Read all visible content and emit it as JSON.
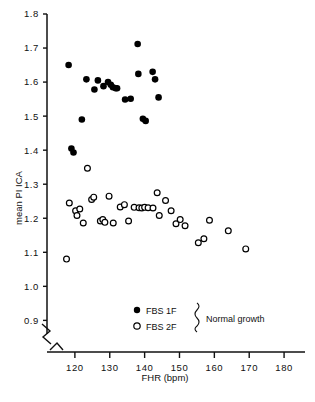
{
  "chart_data": {
    "type": "scatter",
    "title": "",
    "xlabel": "FHR (bpm)",
    "ylabel": "mean PI ICA",
    "xlim": [
      112,
      186
    ],
    "ylim": [
      0.86,
      1.8
    ],
    "xticks": [
      120,
      130,
      140,
      150,
      160,
      170,
      180
    ],
    "yticks": [
      0.9,
      1.0,
      1.1,
      1.2,
      1.3,
      1.4,
      1.5,
      1.6,
      1.7,
      1.8
    ],
    "grid": false,
    "axis_break": true,
    "legend_position": "lower-right",
    "annotations": [
      {
        "text": "Normal growth",
        "target": "legend-brace"
      }
    ],
    "series": [
      {
        "name": "FBS 1F",
        "marker": "filled-circle",
        "color": "#000000",
        "points": [
          [
            118.2,
            1.65
          ],
          [
            119.0,
            1.405
          ],
          [
            119.6,
            1.393
          ],
          [
            122.0,
            1.49
          ],
          [
            123.3,
            1.608
          ],
          [
            125.6,
            1.578
          ],
          [
            126.6,
            1.605
          ],
          [
            128.2,
            1.588
          ],
          [
            129.5,
            1.6
          ],
          [
            130.3,
            1.592
          ],
          [
            130.9,
            1.585
          ],
          [
            131.7,
            1.582
          ],
          [
            132.1,
            1.582
          ],
          [
            134.4,
            1.549
          ],
          [
            136.0,
            1.551
          ],
          [
            138.0,
            1.712
          ],
          [
            138.2,
            1.624
          ],
          [
            139.5,
            1.492
          ],
          [
            140.3,
            1.486
          ],
          [
            142.3,
            1.63
          ],
          [
            143.0,
            1.608
          ],
          [
            144.0,
            1.555
          ]
        ]
      },
      {
        "name": "FBS 2F",
        "marker": "open-circle",
        "color": "#000000",
        "points": [
          [
            117.6,
            1.08
          ],
          [
            118.4,
            1.245
          ],
          [
            120.2,
            1.222
          ],
          [
            120.6,
            1.208
          ],
          [
            121.4,
            1.227
          ],
          [
            122.4,
            1.186
          ],
          [
            123.6,
            1.347
          ],
          [
            124.8,
            1.255
          ],
          [
            125.4,
            1.262
          ],
          [
            127.3,
            1.192
          ],
          [
            128.0,
            1.196
          ],
          [
            128.6,
            1.188
          ],
          [
            129.8,
            1.265
          ],
          [
            131.0,
            1.186
          ],
          [
            133.0,
            1.233
          ],
          [
            134.2,
            1.24
          ],
          [
            135.4,
            1.192
          ],
          [
            137.0,
            1.232
          ],
          [
            138.4,
            1.231
          ],
          [
            139.2,
            1.23
          ],
          [
            140.0,
            1.232
          ],
          [
            141.0,
            1.231
          ],
          [
            142.4,
            1.23
          ],
          [
            143.6,
            1.275
          ],
          [
            144.2,
            1.208
          ],
          [
            146.0,
            1.252
          ],
          [
            147.6,
            1.222
          ],
          [
            149.0,
            1.184
          ],
          [
            150.2,
            1.196
          ],
          [
            151.6,
            1.178
          ],
          [
            155.4,
            1.128
          ],
          [
            157.0,
            1.14
          ],
          [
            158.6,
            1.194
          ],
          [
            164.0,
            1.163
          ],
          [
            169.0,
            1.11
          ]
        ]
      }
    ]
  },
  "legend": {
    "entries": [
      {
        "label": "FBS 1F",
        "marker": "filled-circle"
      },
      {
        "label": "FBS 2F",
        "marker": "open-circle"
      }
    ],
    "bracket_label": "Normal growth"
  }
}
